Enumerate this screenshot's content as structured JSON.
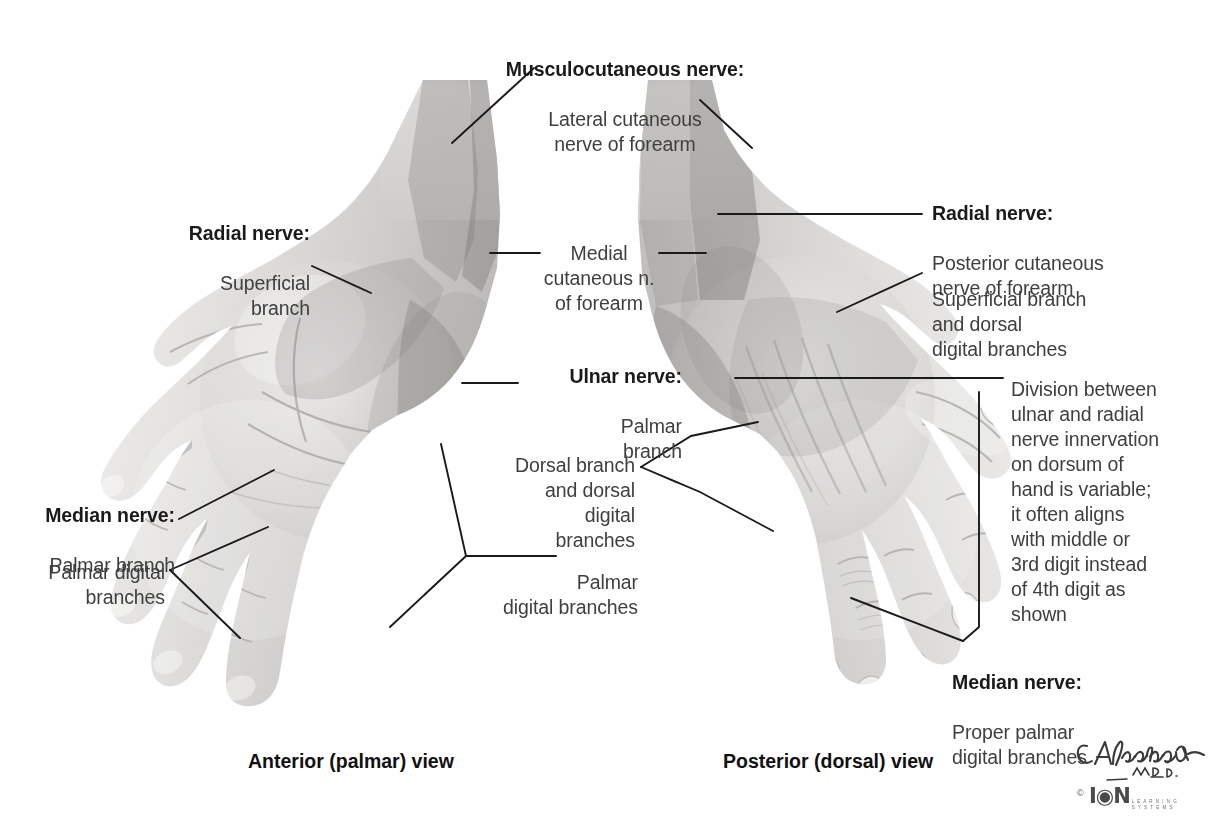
{
  "figure": {
    "background_color": "#ffffff",
    "text_color": "#3f3f3f",
    "heading_color": "#1a1a1a",
    "leader_line_color": "#1a1a1a"
  },
  "labels": {
    "musculocutaneous": {
      "heading": "Musculocutaneous nerve:",
      "body": "Lateral cutaneous\nnerve of forearm"
    },
    "radial_left": {
      "heading": "Radial nerve:",
      "body": "Superficial\nbranch"
    },
    "medial_cutaneous": {
      "body": "Medial\ncutaneous n.\nof forearm"
    },
    "median_left": {
      "heading": "Median nerve:",
      "body": "Palmar branch"
    },
    "palmar_digital_left": {
      "body": "Palmar digital\nbranches"
    },
    "ulnar": {
      "heading": "Ulnar nerve:",
      "body": "Palmar\nbranch"
    },
    "ulnar_dorsal": {
      "body": "Dorsal branch\nand dorsal\ndigital\nbranches"
    },
    "palmar_digital_center": {
      "body": "Palmar\ndigital branches"
    },
    "radial_right": {
      "heading": "Radial nerve:",
      "body": "Posterior cutaneous\nnerve of forearm"
    },
    "radial_superficial_right": {
      "body": "Superficial branch\nand dorsal\ndigital branches"
    },
    "division_note": {
      "body": "Division between\nulnar and radial\nnerve innervation\non dorsum of\nhand is variable;\nit often aligns\nwith middle or\n3rd digit instead\nof 4th digit as\nshown"
    },
    "median_right": {
      "heading": "Median nerve:",
      "body": "Proper palmar\ndigital branches"
    }
  },
  "captions": {
    "left": "Anterior (palmar) view",
    "right": "Posterior (dorsal) view"
  },
  "credit": {
    "signature": "C.Machado",
    "credential": "M.D.",
    "logo_mark": "I◉N",
    "logo_sub_line1": "L E A R N I N G",
    "logo_sub_line2": "S Y S T E M S",
    "copyright": "©"
  }
}
